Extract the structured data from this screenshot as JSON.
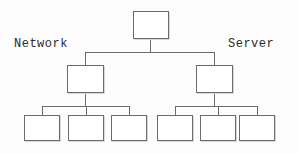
{
  "diagram": {
    "background_color": "#fdfdfd",
    "line_color": "#6b6b6b",
    "text_color": "#2a2a2a",
    "labels": {
      "left": "Network",
      "right": "Server"
    },
    "nodes": [
      {
        "id": "root",
        "label": "",
        "level": 0,
        "x": 133,
        "y": 11,
        "w": 36,
        "h": 28
      },
      {
        "id": "branch-left",
        "label": "",
        "level": 1,
        "x": 67,
        "y": 65,
        "w": 37,
        "h": 28
      },
      {
        "id": "branch-right",
        "label": "",
        "level": 1,
        "x": 196,
        "y": 65,
        "w": 37,
        "h": 28
      },
      {
        "id": "leaf-1",
        "label": "",
        "level": 2,
        "x": 24,
        "y": 115,
        "w": 36,
        "h": 26
      },
      {
        "id": "leaf-2",
        "label": "",
        "level": 2,
        "x": 68,
        "y": 115,
        "w": 36,
        "h": 26
      },
      {
        "id": "leaf-3",
        "label": "",
        "level": 2,
        "x": 111,
        "y": 115,
        "w": 36,
        "h": 26
      },
      {
        "id": "leaf-4",
        "label": "",
        "level": 2,
        "x": 157,
        "y": 115,
        "w": 36,
        "h": 26
      },
      {
        "id": "leaf-5",
        "label": "",
        "level": 2,
        "x": 200,
        "y": 115,
        "w": 36,
        "h": 26
      },
      {
        "id": "leaf-6",
        "label": "",
        "level": 2,
        "x": 239,
        "y": 115,
        "w": 36,
        "h": 26
      }
    ],
    "counts": {
      "root": 1,
      "branches": 2,
      "leaves": 6,
      "leaves_per_branch": 3
    }
  }
}
